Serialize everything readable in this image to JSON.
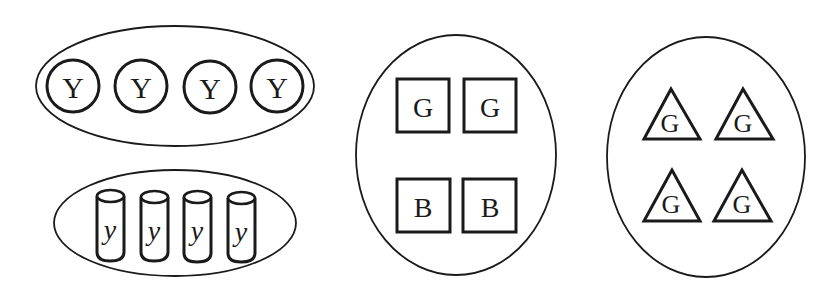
{
  "colors": {
    "ink": "#1a1a1a",
    "background": "#ffffff"
  },
  "groups": [
    {
      "id": "group-circles",
      "container": "ellipse",
      "shape": "circle",
      "items": [
        {
          "label": "Y"
        },
        {
          "label": "Y"
        },
        {
          "label": "Y"
        },
        {
          "label": "Y"
        }
      ]
    },
    {
      "id": "group-cylinders",
      "container": "ellipse",
      "shape": "cylinder",
      "items": [
        {
          "label": "y"
        },
        {
          "label": "y"
        },
        {
          "label": "y"
        },
        {
          "label": "y"
        }
      ]
    },
    {
      "id": "group-squares",
      "container": "ellipse",
      "shape": "square",
      "items": [
        {
          "label": "G"
        },
        {
          "label": "G"
        },
        {
          "label": "B"
        },
        {
          "label": "B"
        }
      ]
    },
    {
      "id": "group-triangles",
      "container": "ellipse",
      "shape": "triangle",
      "items": [
        {
          "label": "G"
        },
        {
          "label": "G"
        },
        {
          "label": "G"
        },
        {
          "label": "G"
        }
      ]
    }
  ]
}
